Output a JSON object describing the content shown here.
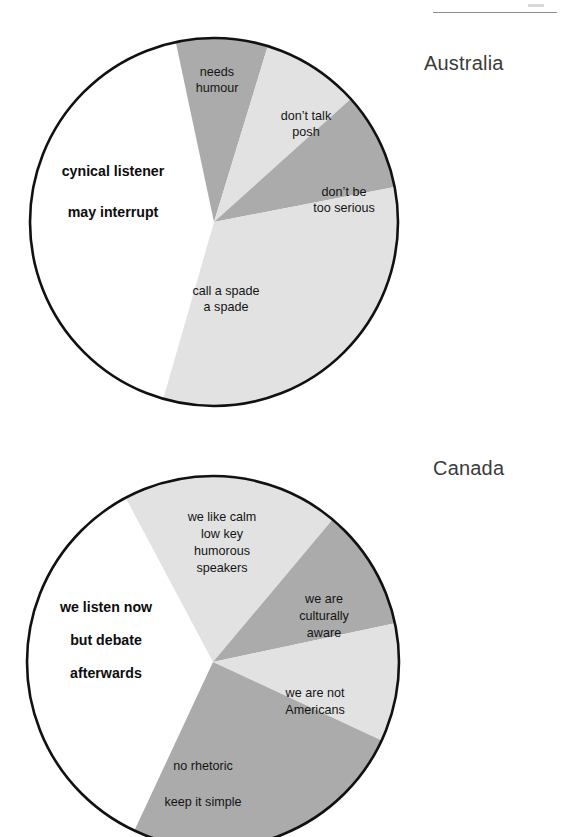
{
  "page": {
    "background": "#ffffff",
    "header_rule_color": "#8e8e8e"
  },
  "palette": {
    "light_gray": "#e2e2e2",
    "medium_gray": "#ababab",
    "white": "#ffffff",
    "outline": "#111111",
    "label_text": "#141414",
    "country_text": "#3b3b3b"
  },
  "charts": [
    {
      "id": "australia",
      "country": "Australia",
      "center": {
        "x": 214,
        "y": 222
      },
      "radius": 184,
      "country_label_pos": {
        "x": 424,
        "y": 52
      },
      "slices": [
        {
          "name": "cynical-listener-may-interrupt",
          "label_lines": [
            "cynical listener",
            "may interrupt"
          ],
          "value": 42,
          "start_angle": 196,
          "end_angle": 348,
          "fill": "#ffffff",
          "bold": true,
          "outside": true,
          "label_pos": {
            "x": 113,
            "y": 176
          },
          "line_gap": 41
        },
        {
          "name": "needs-humour",
          "label_lines": [
            "needs",
            "humour"
          ],
          "value": 8,
          "start_angle": 348,
          "end_angle": 17,
          "fill": "#ababab",
          "bold": false,
          "outside": false,
          "label_pos": {
            "x": 217,
            "y": 76
          },
          "line_gap": 16
        },
        {
          "name": "dont-talk-posh",
          "label_lines": [
            "don’t talk",
            "posh"
          ],
          "value": 9,
          "start_angle": 17,
          "end_angle": 48,
          "fill": "#e2e2e2",
          "bold": false,
          "outside": false,
          "label_pos": {
            "x": 306,
            "y": 120
          },
          "line_gap": 16
        },
        {
          "name": "dont-be-too-serious",
          "label_lines": [
            "don’t be",
            "too serious"
          ],
          "value": 9,
          "start_angle": 48,
          "end_angle": 79,
          "fill": "#ababab",
          "bold": false,
          "outside": false,
          "label_pos": {
            "x": 344,
            "y": 196
          },
          "line_gap": 16
        },
        {
          "name": "call-a-spade-a-spade",
          "label_lines": [
            "call a spade",
            "a spade"
          ],
          "value": 32,
          "start_angle": 79,
          "end_angle": 196,
          "fill": "#e2e2e2",
          "bold": false,
          "outside": false,
          "label_pos": {
            "x": 226,
            "y": 295
          },
          "line_gap": 16
        }
      ]
    },
    {
      "id": "canada",
      "country": "Canada",
      "center": {
        "x": 213,
        "y": 662
      },
      "radius": 186,
      "country_label_pos": {
        "x": 433,
        "y": 457
      },
      "slices": [
        {
          "name": "we-listen-now-but-debate-afterwards",
          "label_lines": [
            "we listen now",
            "but debate",
            "afterwards"
          ],
          "value": 35,
          "start_angle": 205,
          "end_angle": 332,
          "fill": "#ffffff",
          "bold": true,
          "outside": true,
          "label_pos": {
            "x": 106,
            "y": 612
          },
          "line_gap": 33,
          "extra_gap_after": 1
        },
        {
          "name": "we-like-calm-low-key-humorous-speakers",
          "label_lines": [
            "we like calm",
            "low key",
            "humorous",
            "speakers"
          ],
          "value": 19,
          "start_angle": 332,
          "end_angle": 40,
          "fill": "#e2e2e2",
          "bold": false,
          "outside": false,
          "label_pos": {
            "x": 222,
            "y": 521
          },
          "line_gap": 17
        },
        {
          "name": "we-are-culturally-aware",
          "label_lines": [
            "we are",
            "culturally",
            "aware"
          ],
          "value": 11,
          "start_angle": 40,
          "end_angle": 78,
          "fill": "#ababab",
          "bold": false,
          "outside": false,
          "label_pos": {
            "x": 324,
            "y": 603
          },
          "line_gap": 17
        },
        {
          "name": "we-are-not-americans",
          "label_lines": [
            "we are not",
            "Americans"
          ],
          "value": 10,
          "start_angle": 78,
          "end_angle": 115,
          "fill": "#e2e2e2",
          "bold": false,
          "outside": false,
          "label_pos": {
            "x": 315,
            "y": 697
          },
          "line_gap": 17
        },
        {
          "name": "no-rhetoric-keep-it-simple",
          "label_lines": [
            "no rhetoric",
            "keep it simple"
          ],
          "value": 25,
          "start_angle": 115,
          "end_angle": 205,
          "fill": "#ababab",
          "bold": false,
          "outside": false,
          "label_pos": {
            "x": 203,
            "y": 770
          },
          "line_gap": 36
        }
      ]
    }
  ],
  "chart_data": {
    "type": "pie",
    "title": "",
    "charts": [
      {
        "title": "Australia",
        "categories": [
          "cynical listener may interrupt",
          "needs humour",
          "don’t talk posh",
          "don’t be too serious",
          "call a spade a spade"
        ],
        "values": [
          42,
          8,
          9,
          9,
          32
        ],
        "units": "percent of circle",
        "colors": [
          "#ffffff",
          "#ababab",
          "#e2e2e2",
          "#ababab",
          "#e2e2e2"
        ],
        "legend": "none (labels inside slices)"
      },
      {
        "title": "Canada",
        "categories": [
          "we listen now but debate afterwards",
          "we like calm low key humorous speakers",
          "we are culturally aware",
          "we are not Americans",
          "no rhetoric keep it simple"
        ],
        "values": [
          35,
          19,
          11,
          10,
          25
        ],
        "units": "percent of circle",
        "colors": [
          "#ffffff",
          "#e2e2e2",
          "#ababab",
          "#e2e2e2",
          "#ababab"
        ],
        "legend": "none (labels inside slices)"
      }
    ]
  }
}
